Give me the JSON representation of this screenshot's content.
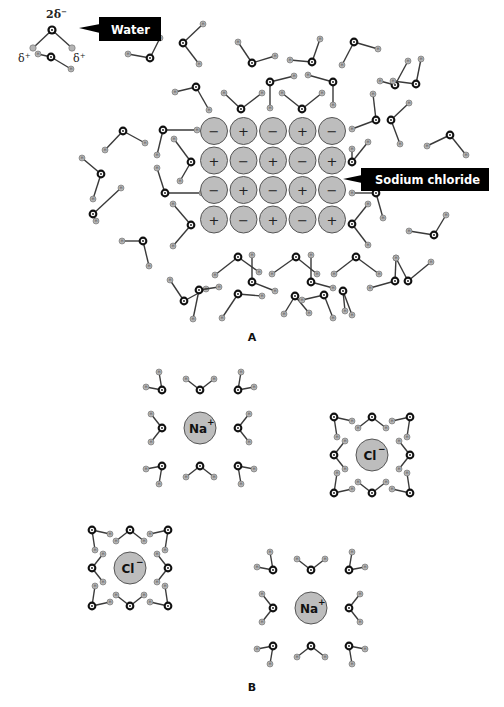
{
  "figure": {
    "panel_a_label": "A",
    "panel_b_label": "B",
    "callouts": {
      "water": "Water",
      "sodium_chloride": "Sodium chloride"
    },
    "water_legend": {
      "oxygen_charge": "2δ",
      "oxygen_charge_sup": "−",
      "hydrogen_charge_left": "δ",
      "hydrogen_charge_right": "δ",
      "hydrogen_charge_sup": "+"
    },
    "ions": {
      "sodium": "Na",
      "sodium_sup": "+",
      "chloride": "Cl",
      "chloride_sup": "−"
    },
    "colors": {
      "ion_fill": "#bdbdbd",
      "hydrogen_fill": "#b4b4b4",
      "oxygen": "#111111",
      "callout": "#000000"
    }
  },
  "lattice": {
    "rows": [
      [
        "−",
        "+",
        "−",
        "+",
        "−"
      ],
      [
        "+",
        "−",
        "+",
        "−",
        "+"
      ],
      [
        "−",
        "+",
        "−",
        "+",
        "−"
      ],
      [
        "+",
        "−",
        "+",
        "−",
        "+"
      ]
    ],
    "origin_x": 214,
    "origin_y": 131,
    "spacing": 29.5,
    "radius": 13.5
  },
  "waters_a": [
    [
      51,
      57,
      38,
      54,
      71,
      69
    ],
    [
      150,
      58,
      160,
      38,
      128,
      54
    ],
    [
      183,
      43,
      203,
      24,
      199,
      64
    ],
    [
      252,
      63,
      238,
      42,
      275,
      56
    ],
    [
      312,
      62,
      320,
      39,
      290,
      60
    ],
    [
      354,
      42,
      378,
      49,
      342,
      65
    ],
    [
      395,
      85,
      408,
      61,
      380,
      81
    ],
    [
      196,
      87,
      175,
      92,
      209,
      110
    ],
    [
      270,
      82,
      294,
      76,
      270,
      108
    ],
    [
      333,
      82,
      308,
      75,
      333,
      105
    ],
    [
      241,
      109,
      224,
      93,
      262,
      93
    ],
    [
      302,
      109,
      282,
      93,
      322,
      93
    ],
    [
      416,
      84,
      393,
      81,
      421,
      59
    ],
    [
      376,
      120,
      373,
      94,
      352,
      129
    ],
    [
      391,
      120,
      409,
      103,
      400,
      144
    ],
    [
      450,
      135,
      427,
      146,
      466,
      155
    ],
    [
      123,
      131,
      105,
      150,
      145,
      143
    ],
    [
      163,
      130,
      197,
      130,
      157,
      155
    ],
    [
      191,
      162,
      174,
      139,
      180,
      181
    ],
    [
      101,
      174,
      82,
      158,
      93,
      199
    ],
    [
      165,
      193,
      157,
      168,
      202,
      193
    ],
    [
      352,
      162,
      368,
      142,
      352,
      149
    ],
    [
      376,
      193,
      352,
      193,
      383,
      218
    ],
    [
      93,
      214,
      121,
      188,
      96,
      221
    ],
    [
      191,
      225,
      173,
      204,
      173,
      246
    ],
    [
      352,
      224,
      368,
      204,
      368,
      245
    ],
    [
      143,
      241,
      122,
      241,
      149,
      266
    ],
    [
      434,
      235,
      446,
      215,
      409,
      231
    ],
    [
      408,
      281,
      396,
      258,
      431,
      262
    ],
    [
      184,
      301,
      170,
      280,
      206,
      289
    ],
    [
      238,
      257,
      215,
      275,
      259,
      272
    ],
    [
      252,
      282,
      252,
      255,
      275,
      291
    ],
    [
      296,
      257,
      272,
      274,
      317,
      274
    ],
    [
      311,
      282,
      311,
      255,
      333,
      288
    ],
    [
      356,
      257,
      334,
      274,
      379,
      274
    ],
    [
      343,
      291,
      352,
      315,
      345,
      311
    ],
    [
      199,
      290,
      219,
      287,
      193,
      319
    ],
    [
      238,
      294,
      222,
      318,
      262,
      296
    ],
    [
      295,
      296,
      284,
      314,
      309,
      313
    ],
    [
      324,
      295,
      302,
      300,
      333,
      318
    ],
    [
      395,
      281,
      396,
      258,
      370,
      288
    ]
  ],
  "clusters": [
    {
      "ion": "sodium",
      "cx": 200,
      "cy": 428,
      "r": 16
    },
    {
      "ion": "chloride",
      "cx": 372,
      "cy": 455,
      "r": 16
    },
    {
      "ion": "chloride",
      "cx": 130,
      "cy": 568,
      "r": 16
    },
    {
      "ion": "sodium",
      "cx": 311,
      "cy": 608,
      "r": 16
    }
  ]
}
